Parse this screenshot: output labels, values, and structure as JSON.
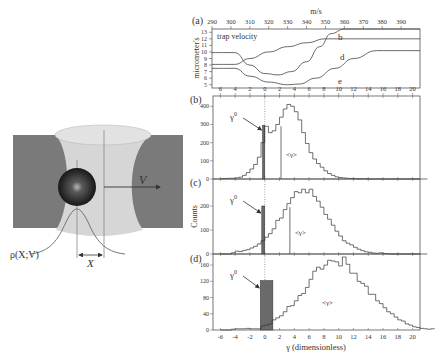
{
  "illustration": {
    "velocity_label": "V",
    "displacement_label": "X",
    "distribution_label": "ρ(X;V)"
  },
  "panel_labels": [
    "(a)",
    "(b)",
    "(c)",
    "(d)"
  ],
  "chart_data": [
    {
      "id": "a",
      "type": "line",
      "title": "trap velocity",
      "xlabel": "m/s",
      "ylabel": "micrometer's",
      "xlim": [
        290,
        400
      ],
      "ylim": [
        4.5,
        13.5
      ],
      "x_ticks": [
        290,
        300,
        310,
        320,
        330,
        340,
        350,
        360,
        370,
        380,
        390
      ],
      "y_ticks": [
        5,
        6,
        7,
        8,
        9,
        10,
        11,
        12,
        13
      ],
      "series": [
        {
          "name": "b",
          "points": [
            [
              290,
              8.1
            ],
            [
              302,
              8.1
            ],
            [
              310,
              9.0
            ],
            [
              320,
              10.0
            ],
            [
              330,
              10.8
            ],
            [
              340,
              11.4
            ],
            [
              350,
              12.0
            ],
            [
              400,
              12.0
            ]
          ]
        },
        {
          "name": "d",
          "points": [
            [
              290,
              9.9
            ],
            [
              302,
              9.9
            ],
            [
              310,
              8.0
            ],
            [
              318,
              6.7
            ],
            [
              325,
              6.5
            ],
            [
              332,
              7.0
            ],
            [
              340,
              8.5
            ],
            [
              347,
              10.8
            ],
            [
              353,
              12.8
            ],
            [
              360,
              13.5
            ],
            [
              400,
              13.5
            ]
          ]
        },
        {
          "name": "e",
          "points": [
            [
              290,
              7.5
            ],
            [
              302,
              7.5
            ],
            [
              310,
              6.3
            ],
            [
              320,
              5.4
            ],
            [
              330,
              5.0
            ],
            [
              336,
              5.1
            ],
            [
              345,
              6.0
            ],
            [
              355,
              7.5
            ],
            [
              365,
              9.0
            ],
            [
              377,
              10.2
            ],
            [
              400,
              10.2
            ]
          ]
        }
      ]
    },
    {
      "id": "b",
      "type": "bar",
      "xlabel": "",
      "ylabel": "",
      "xlim": [
        -7,
        21
      ],
      "ylim": [
        0,
        440
      ],
      "x_ticks": [
        -6,
        -4,
        -2,
        0,
        2,
        4,
        6,
        8,
        10,
        12,
        14,
        16,
        18,
        20
      ],
      "x_tick_labels": [
        "6",
        "4",
        "2",
        "0",
        "2",
        "4",
        "6",
        "8",
        "10",
        "12",
        "14",
        "16",
        "18",
        "20"
      ],
      "y_ticks": [
        0,
        100,
        200,
        300,
        400
      ],
      "bin_width": 0.5,
      "bin_start": -6,
      "counts": [
        2,
        3,
        4,
        4,
        6,
        10,
        20,
        35,
        55,
        80,
        120,
        200,
        290,
        255,
        265,
        300,
        340,
        385,
        410,
        400,
        370,
        325,
        255,
        195,
        145,
        110,
        85,
        65,
        45,
        30,
        20,
        12,
        8,
        6,
        4,
        3,
        2,
        1,
        1,
        1,
        0,
        0,
        0,
        0,
        0,
        0,
        0,
        0,
        0,
        0,
        0,
        0,
        0,
        0,
        0,
        0
      ],
      "gamma0": {
        "label": "γ⁰",
        "x_from": -0.3,
        "x_to": 0.0,
        "height": 295
      },
      "mean": {
        "label": "<γ>",
        "x": 2.2,
        "height": 290
      }
    },
    {
      "id": "c",
      "type": "bar",
      "xlabel": "",
      "ylabel": "Counts",
      "xlim": [
        -7,
        21
      ],
      "ylim": [
        0,
        300
      ],
      "x_ticks": [
        -6,
        -4,
        -2,
        0,
        2,
        4,
        6,
        8,
        10,
        12,
        14,
        16,
        18,
        20
      ],
      "y_ticks": [
        0,
        100,
        200
      ],
      "bin_width": 0.5,
      "bin_start": -6,
      "counts": [
        0,
        0,
        0,
        5,
        12,
        10,
        15,
        18,
        25,
        32,
        42,
        55,
        70,
        85,
        105,
        140,
        150,
        185,
        210,
        235,
        260,
        255,
        270,
        255,
        270,
        240,
        220,
        195,
        165,
        145,
        120,
        95,
        75,
        55,
        45,
        38,
        28,
        20,
        14,
        9,
        7,
        4,
        3,
        5,
        2,
        1,
        0,
        0,
        0,
        0,
        0,
        0,
        0,
        0,
        0,
        0
      ],
      "gamma0": {
        "label": "γ⁰",
        "x_from": -0.4,
        "x_to": 0.0,
        "height": 200
      },
      "mean": {
        "label": "<γ>",
        "x": 3.4,
        "height": 195
      }
    },
    {
      "id": "d",
      "type": "bar",
      "xlabel": "γ (dimensionless)",
      "ylabel": "",
      "xlim": [
        -7,
        21
      ],
      "ylim": [
        0,
        180
      ],
      "x_ticks": [
        -6,
        -4,
        -2,
        0,
        2,
        4,
        6,
        8,
        10,
        12,
        14,
        16,
        18,
        20
      ],
      "x_tick_labels": [
        "-6",
        "-4",
        "-2",
        "0",
        "2",
        "4",
        "6",
        "8",
        "10",
        "12",
        "14",
        "16",
        "18",
        "20"
      ],
      "y_ticks": [
        0,
        40,
        80,
        120,
        160
      ],
      "bin_width": 0.5,
      "bin_start": -6,
      "counts": [
        0,
        0,
        0,
        2,
        3,
        3,
        3,
        4,
        3,
        3,
        3,
        10,
        12,
        15,
        25,
        30,
        35,
        45,
        58,
        60,
        72,
        85,
        90,
        105,
        125,
        145,
        155,
        150,
        160,
        172,
        170,
        168,
        158,
        180,
        162,
        140,
        140,
        120,
        115,
        108,
        88,
        88,
        72,
        65,
        55,
        45,
        40,
        32,
        25,
        22,
        15,
        12,
        8,
        6,
        4,
        3,
        2,
        3
      ],
      "gamma0": {
        "label": "γ⁰",
        "x_from": -0.6,
        "x_to": 1.1,
        "height": 122
      },
      "mean": {
        "label": "<γ>",
        "x": 8.5,
        "height": 0
      }
    }
  ]
}
